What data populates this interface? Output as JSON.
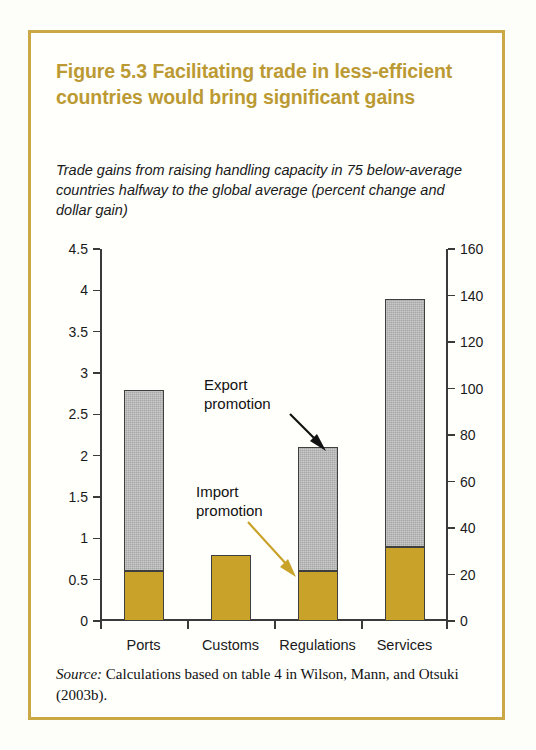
{
  "figure": {
    "title": "Figure 5.3  Facilitating trade in less-efficient countries would bring significant gains",
    "subtitle": "Trade gains from raising handling capacity in 75 below-average countries halfway to the global average (percent change and dollar gain)",
    "source_word": "Source:",
    "source_text": " Calculations based on table 4 in Wilson, Mann, and Otsuki (2003b).",
    "frame_color": "#c9a845",
    "title_color": "#bc9a33"
  },
  "annotations": [
    {
      "name": "export-promotion",
      "label": "Export\npromotion",
      "arrow_color": "#111111"
    },
    {
      "name": "import-promotion",
      "label": "Import\npromotion",
      "arrow_color": "#c9a22a"
    }
  ],
  "chart_data": {
    "type": "bar",
    "stacked": true,
    "title": "Figure 5.3  Facilitating trade in less-efficient countries would bring significant gains",
    "subtitle": "Trade gains from raising handling capacity in 75 below-average countries halfway to the global average (percent change and dollar gain)",
    "xlabel": "",
    "ylabel": "",
    "categories": [
      "Ports",
      "Customs",
      "Regulations",
      "Services"
    ],
    "series": [
      {
        "name": "Import promotion",
        "color": "#c9a22a",
        "values": [
          0.6,
          0.8,
          0.6,
          0.9
        ]
      },
      {
        "name": "Export promotion",
        "color": "#a8a8a8",
        "values": [
          2.2,
          0.0,
          1.5,
          3.0
        ]
      }
    ],
    "totals": [
      2.8,
      0.8,
      2.1,
      3.9
    ],
    "left_axis": {
      "label": "percent change",
      "ylim": [
        0,
        4.5
      ],
      "ticks": [
        "0",
        "0.5",
        "1",
        "1.5",
        "2",
        "2.5",
        "3",
        "3.5",
        "4",
        "4.5"
      ],
      "tick_values": [
        0,
        0.5,
        1,
        1.5,
        2,
        2.5,
        3,
        3.5,
        4,
        4.5
      ]
    },
    "right_axis": {
      "label": "dollar gain (billions)",
      "ylim": [
        0,
        160
      ],
      "ticks": [
        "0",
        "20",
        "40",
        "60",
        "80",
        "100",
        "120",
        "140",
        "160"
      ],
      "tick_values": [
        0,
        20,
        40,
        60,
        80,
        100,
        120,
        140,
        160
      ]
    },
    "grid": false,
    "legend_position": "annotations"
  }
}
